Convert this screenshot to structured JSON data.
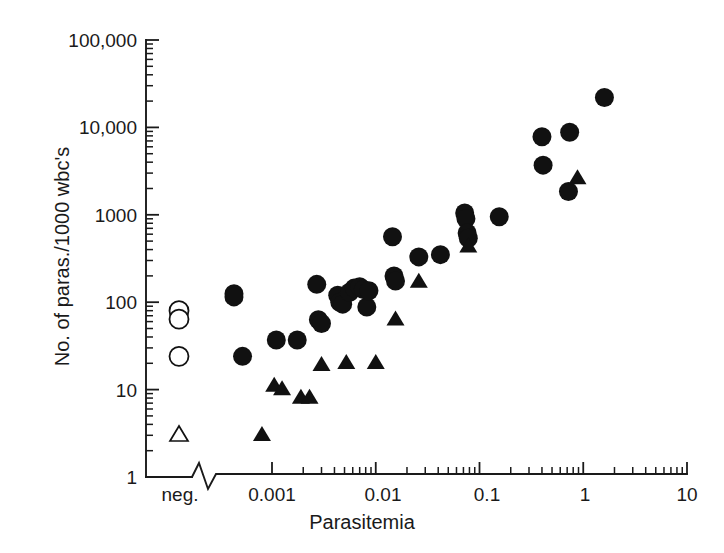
{
  "chart_data": {
    "type": "scatter",
    "title": "",
    "xlabel": "Parasitemia",
    "ylabel": "No. of paras./1000 wbc's",
    "xscale": "log",
    "yscale": "log",
    "xlim": [
      0.0003,
      10
    ],
    "ylim": [
      1,
      100000
    ],
    "grid": false,
    "legend": "none",
    "axis_break": {
      "present": true,
      "axis": "x",
      "note": "zigzag break between the neg. category column and the log scale"
    },
    "x_categories": [
      "neg."
    ],
    "x_tick_labels": [
      "neg.",
      "0.001",
      "0.01",
      "0.1",
      "1",
      "10"
    ],
    "x_tick_values": [
      null,
      0.001,
      0.01,
      0.1,
      1,
      10
    ],
    "y_tick_labels": [
      "100,000",
      "10,000",
      "1000",
      "100",
      "10",
      "1"
    ],
    "y_tick_values": [
      100000,
      10000,
      1000,
      100,
      10,
      1
    ],
    "series": [
      {
        "name": "filled-circle",
        "marker": "filled circle",
        "points": [
          [
            0.00043,
            125
          ],
          [
            0.00043,
            115
          ],
          [
            0.00052,
            24
          ],
          [
            0.0011,
            37
          ],
          [
            0.00175,
            37
          ],
          [
            0.0027,
            160
          ],
          [
            0.0028,
            63
          ],
          [
            0.003,
            57
          ],
          [
            0.0043,
            120
          ],
          [
            0.0045,
            100
          ],
          [
            0.0048,
            95
          ],
          [
            0.0056,
            130
          ],
          [
            0.0062,
            145
          ],
          [
            0.007,
            150
          ],
          [
            0.0076,
            140
          ],
          [
            0.0082,
            88
          ],
          [
            0.0086,
            135
          ],
          [
            0.0145,
            560
          ],
          [
            0.015,
            200
          ],
          [
            0.0155,
            175
          ],
          [
            0.026,
            330
          ],
          [
            0.042,
            350
          ],
          [
            0.072,
            1050
          ],
          [
            0.074,
            900
          ],
          [
            0.076,
            620
          ],
          [
            0.078,
            540
          ],
          [
            0.155,
            950
          ],
          [
            0.4,
            7800
          ],
          [
            0.41,
            3700
          ],
          [
            0.72,
            1850
          ],
          [
            0.74,
            8800
          ],
          [
            1.6,
            22000
          ]
        ]
      },
      {
        "name": "filled-triangle",
        "marker": "filled triangle",
        "points": [
          [
            0.0008,
            3.0
          ],
          [
            0.00105,
            11
          ],
          [
            0.00125,
            10
          ],
          [
            0.0019,
            8.0
          ],
          [
            0.0023,
            8.0
          ],
          [
            0.003,
            19
          ],
          [
            0.0052,
            20
          ],
          [
            0.01,
            20
          ],
          [
            0.0155,
            63
          ],
          [
            0.026,
            170
          ],
          [
            0.078,
            430
          ],
          [
            0.88,
            2600
          ]
        ]
      },
      {
        "name": "open-circle",
        "marker": "open circle",
        "points": [
          [
            "neg.",
            80
          ],
          [
            "neg.",
            64
          ],
          [
            "neg.",
            24
          ]
        ]
      },
      {
        "name": "open-triangle",
        "marker": "open triangle",
        "points": [
          [
            "neg.",
            3.0
          ]
        ]
      }
    ]
  },
  "axes": {
    "x_title": "Parasitemia",
    "y_title": "No. of paras./1000 wbc's",
    "x_labels": [
      {
        "text": "neg.",
        "pos": 180
      },
      {
        "text": "0.001",
        "pos": 272
      },
      {
        "text": "0.01",
        "pos": 383
      },
      {
        "text": "0.1",
        "pos": 487
      },
      {
        "text": "1",
        "pos": 585
      },
      {
        "text": "10",
        "pos": 687
      }
    ],
    "y_labels": [
      {
        "text": "100,000",
        "pos": 40
      },
      {
        "text": "10,000",
        "pos": 127
      },
      {
        "text": "1000",
        "pos": 215
      },
      {
        "text": "100",
        "pos": 302
      },
      {
        "text": "10",
        "pos": 390
      },
      {
        "text": "1",
        "pos": 477
      }
    ]
  }
}
